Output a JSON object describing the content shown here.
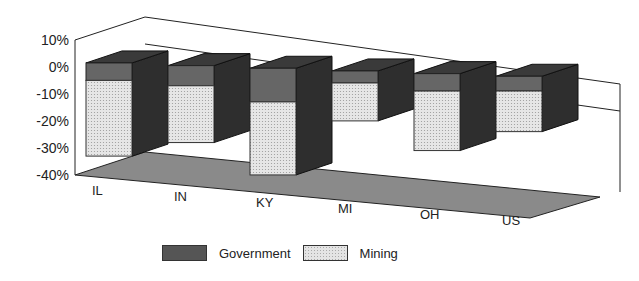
{
  "chart_data": {
    "type": "bar",
    "subtype": "3d-stacked",
    "title": "",
    "xlabel": "",
    "ylabel": "",
    "categories": [
      "IL",
      "IN",
      "KY",
      "MI",
      "OH",
      "US"
    ],
    "series": [
      {
        "name": "Government",
        "color": "#555555",
        "values": [
          -2,
          -3,
          -8,
          0,
          -2,
          -1
        ]
      },
      {
        "name": "Mining",
        "color": "#e4e4e4",
        "values": [
          -31,
          -24,
          -30,
          -17,
          -25,
          -18
        ]
      }
    ],
    "yticks": [
      "10%",
      "0%",
      "-10%",
      "-20%",
      "-30%",
      "-40%"
    ],
    "ylim": [
      -40,
      10
    ],
    "grid": false,
    "legend_position": "bottom"
  },
  "legend": {
    "government": "Government",
    "mining": "Mining"
  }
}
